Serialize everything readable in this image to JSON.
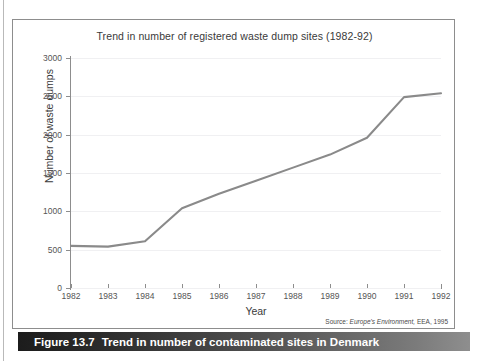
{
  "figure": {
    "caption_number": "Figure 13.7",
    "caption_text": "Trend in number of contaminated sites in Denmark"
  },
  "chart_data": {
    "type": "line",
    "title": "Trend in number of registered waste dump sites (1982-92)",
    "xlabel": "Year",
    "ylabel": "Number of waste dumps",
    "x": [
      1982,
      1983,
      1984,
      1985,
      1986,
      1987,
      1988,
      1989,
      1990,
      1991,
      1992
    ],
    "values": [
      550,
      540,
      610,
      1040,
      1230,
      1400,
      1570,
      1740,
      1960,
      2490,
      2540
    ],
    "xlim": [
      1982,
      1992
    ],
    "ylim": [
      0,
      3000
    ],
    "ytick_labels": [
      "0",
      "500",
      "1000",
      "1500",
      "2000",
      "2500",
      "3000"
    ],
    "yticks": [
      0,
      500,
      1000,
      1500,
      2000,
      2500,
      3000
    ],
    "xtick_labels": [
      "1982",
      "1983",
      "1984",
      "1985",
      "1986",
      "1987",
      "1988",
      "1989",
      "1990",
      "1991",
      "1992"
    ],
    "grid": "horizontal",
    "legend": "none",
    "line_color": "#8a8a8a",
    "grid_color": "#f0f0f2",
    "axis_color": "#8d8d8d",
    "source_prefix": "Source:",
    "source_italic": "Europe's Environment,",
    "source_suffix": "EEA, 1995"
  }
}
